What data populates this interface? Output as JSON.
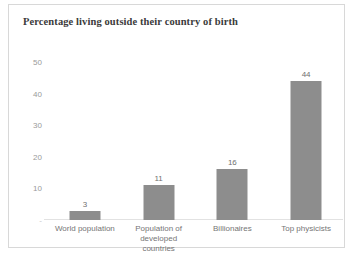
{
  "chart_data": {
    "type": "bar",
    "title": "Percentage living outside their country of birth",
    "xlabel": "",
    "ylabel": "",
    "categories": [
      "World population",
      "Population of developed countries",
      "Billionaires",
      "Top physicists"
    ],
    "category_lines": [
      [
        "World population"
      ],
      [
        "Population of",
        "developed countries"
      ],
      [
        "Billionaires"
      ],
      [
        "Top physicists"
      ]
    ],
    "values": [
      3,
      11,
      16,
      44
    ],
    "value_labels": [
      "3",
      "11",
      "16",
      "44"
    ],
    "ylim": [
      0,
      50
    ],
    "yticks": [
      50,
      40,
      30,
      20,
      10,
      0
    ],
    "ytick_labels": [
      "50",
      "40",
      "30",
      "20",
      "10",
      "-"
    ],
    "grid": false,
    "legend": false,
    "bar_color": "#8d8d8d",
    "axis_color": "#e2e2e2",
    "text_color": "#757575",
    "title_color": "#3b3b3b",
    "frame_color": "#d8d8d8",
    "background": "#ffffff"
  }
}
